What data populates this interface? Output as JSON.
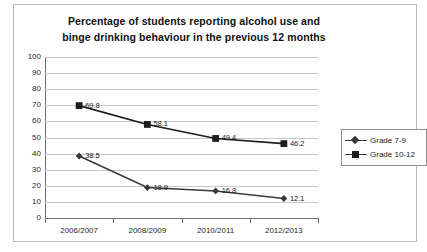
{
  "chart_data": {
    "type": "line",
    "title": "Percentage of students reporting alcohol use and binge drinking behaviour in the previous 12 months",
    "title_lines": [
      "Percentage of students reporting alcohol use and",
      "binge drinking behaviour in the previous 12 months"
    ],
    "xlabel": "",
    "ylabel": "",
    "categories": [
      "2006/2007",
      "2008/2009",
      "2010/2011",
      "2012/2013"
    ],
    "ylim": [
      0,
      100
    ],
    "yticks": [
      100,
      90,
      80,
      70,
      60,
      50,
      40,
      30,
      20,
      10,
      0
    ],
    "grid": true,
    "legend_position": "right",
    "series": [
      {
        "name": "Grade 7-9",
        "marker": "diamond",
        "color": "#3a3a3a",
        "values": [
          38.5,
          18.9,
          16.8,
          12.1
        ],
        "labels": [
          "38.5",
          "18.9",
          "16.8",
          "12.1"
        ]
      },
      {
        "name": "Grade 10-12",
        "marker": "square",
        "color": "#1c1c1c",
        "values": [
          69.8,
          58.1,
          49.4,
          46.2
        ],
        "labels": [
          "69.8",
          "58.1",
          "49.4",
          "46.2"
        ]
      }
    ]
  }
}
